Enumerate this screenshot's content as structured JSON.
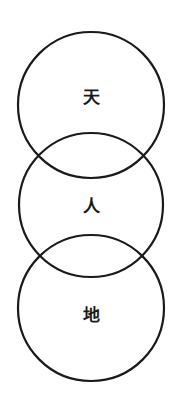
{
  "diagram": {
    "stroke_color": "#1a1a1a",
    "background": "#ffffff",
    "circles": [
      {
        "label": "天",
        "cx": 91,
        "cy": 105,
        "r": 73,
        "label_y": 97
      },
      {
        "label": "人",
        "cx": 91,
        "cy": 205,
        "r": 72,
        "label_y": 206
      },
      {
        "label": "地",
        "cx": 91,
        "cy": 308,
        "r": 73,
        "label_y": 315
      }
    ]
  }
}
